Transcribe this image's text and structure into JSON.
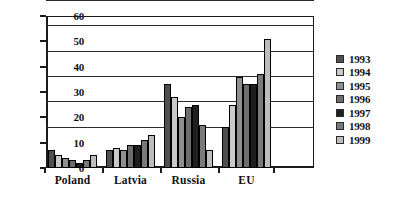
{
  "chart_data": {
    "type": "bar",
    "title": "",
    "xlabel": "",
    "ylabel": "",
    "ylim": [
      0,
      60
    ],
    "yticks": [
      0,
      10,
      20,
      30,
      40,
      50,
      60
    ],
    "grid": true,
    "legend_position": "right",
    "categories": [
      "Poland",
      "Latvia",
      "Russia",
      "EU"
    ],
    "series": [
      {
        "name": "1993",
        "color": "#4f4f4f",
        "values": [
          7,
          7,
          33,
          16
        ]
      },
      {
        "name": "1994",
        "color": "#c9c9c9",
        "values": [
          5,
          8,
          28,
          25
        ]
      },
      {
        "name": "1995",
        "color": "#8f8f8f",
        "values": [
          4,
          7,
          20,
          36
        ]
      },
      {
        "name": "1996",
        "color": "#6d6d6d",
        "values": [
          3,
          9,
          24,
          33
        ]
      },
      {
        "name": "1997",
        "color": "#1f1f1f",
        "values": [
          2,
          9,
          25,
          33
        ]
      },
      {
        "name": "1998",
        "color": "#7a7a7a",
        "values": [
          3,
          11,
          17,
          37
        ]
      },
      {
        "name": "1999",
        "color": "#bdbdbd",
        "values": [
          5,
          13,
          7,
          51
        ]
      }
    ]
  }
}
